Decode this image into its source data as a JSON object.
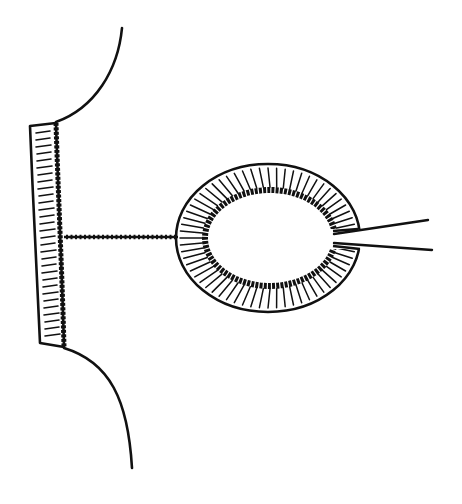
{
  "figure": {
    "type": "line-art illustration",
    "colors": {
      "background": "#ffffff",
      "ink": "#111111"
    },
    "elements": {
      "wall": {
        "label": "hatched wall segment"
      },
      "upper_contour": {
        "label": "upper curved contour"
      },
      "lower_contour": {
        "label": "lower curved contour"
      },
      "tract": {
        "label": "stippled connecting tract"
      },
      "ring": {
        "label": "hatched ring structure",
        "outer": {
          "cx": 268,
          "cy": 238,
          "rx": 92,
          "ry": 74
        },
        "inner": {
          "cx": 270,
          "cy": 238,
          "rx": 65,
          "ry": 48
        }
      },
      "instrument": {
        "label": "two diverging instrument lines"
      }
    }
  }
}
